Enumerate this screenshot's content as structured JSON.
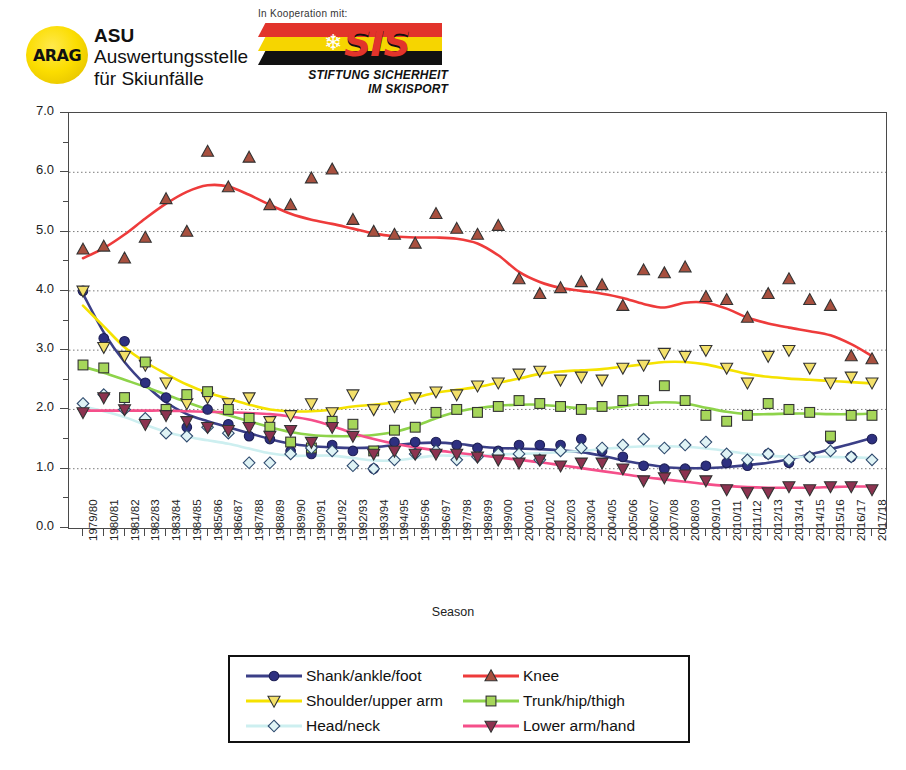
{
  "header": {
    "arag_logo_text": "ARAG",
    "asu_line1": "ASU",
    "asu_line2": "Auswertungsstelle",
    "asu_line3": "für Skiunfälle",
    "kooperation_text": "In Kooperation mit:",
    "sis_wordmark": "SIS",
    "sis_sub1": "STIFTUNG SICHERHEIT",
    "sis_sub2": "IM SKISPORT"
  },
  "chart_data": {
    "type": "scatter",
    "title": "",
    "xlabel": "Season",
    "ylabel": "",
    "ylim": [
      0.0,
      7.0
    ],
    "ytick_labels": [
      "0.0",
      "1.0",
      "2.0",
      "3.0",
      "4.0",
      "5.0",
      "6.0",
      "7.0"
    ],
    "ytick_values": [
      0.0,
      1.0,
      2.0,
      3.0,
      4.0,
      5.0,
      6.0,
      7.0
    ],
    "yminor_step": 0.5,
    "grid": "horizontal-dotted",
    "legend_position": "bottom-center",
    "categories": [
      "1979/80",
      "1980/81",
      "1981/82",
      "1982/83",
      "1983/84",
      "1984/85",
      "1985/86",
      "1986/87",
      "1987/88",
      "1988/89",
      "1989/90",
      "1990/91",
      "1991/92",
      "1992/93",
      "1993/94",
      "1994/95",
      "1995/96",
      "1996/97",
      "1997/98",
      "1998/99",
      "1999/00",
      "2000/01",
      "2001/02",
      "2002/03",
      "2003/04",
      "2004/05",
      "2005/06",
      "2006/07",
      "2007/08",
      "2008/09",
      "2009/10",
      "2010/11",
      "2011/12",
      "2012/13",
      "2013/14",
      "2014/15",
      "2015/16",
      "2016/17",
      "2017/18"
    ],
    "series": [
      {
        "name": "Shank/ankle/foot",
        "color": "#3b3f87",
        "marker": "circle",
        "marker_fill": "#2e3080",
        "values": [
          4.0,
          3.2,
          3.15,
          2.45,
          2.2,
          1.7,
          2.0,
          1.75,
          1.55,
          1.5,
          1.3,
          1.25,
          1.4,
          1.3,
          1.0,
          1.45,
          1.45,
          1.45,
          1.4,
          1.35,
          1.3,
          1.4,
          1.4,
          1.4,
          1.5,
          1.3,
          1.2,
          1.05,
          1.0,
          1.0,
          1.05,
          1.1,
          1.05,
          1.25,
          1.1,
          1.2,
          1.5,
          1.2,
          1.5
        ],
        "trend": [
          3.95,
          3.3,
          2.8,
          2.42,
          2.12,
          1.92,
          1.8,
          1.7,
          1.6,
          1.5,
          1.42,
          1.38,
          1.36,
          1.35,
          1.36,
          1.4,
          1.43,
          1.44,
          1.42,
          1.38,
          1.35,
          1.34,
          1.33,
          1.31,
          1.28,
          1.22,
          1.14,
          1.08,
          1.03,
          1.01,
          1.01,
          1.03,
          1.06,
          1.1,
          1.16,
          1.24,
          1.33,
          1.42,
          1.52
        ]
      },
      {
        "name": "Knee",
        "color": "#ee3b3b",
        "marker": "triangle-up",
        "marker_fill": "#a8503f",
        "values": [
          4.7,
          4.75,
          4.55,
          4.9,
          5.55,
          5.0,
          6.35,
          5.75,
          6.25,
          5.45,
          5.45,
          5.9,
          6.05,
          5.2,
          5.0,
          4.95,
          4.8,
          5.3,
          5.05,
          4.95,
          5.1,
          4.2,
          3.95,
          4.05,
          4.15,
          4.1,
          3.75,
          4.35,
          4.3,
          4.4,
          3.9,
          3.85,
          3.55,
          3.95,
          4.2,
          3.85,
          3.75,
          2.9,
          2.85
        ],
        "trend": [
          4.55,
          4.72,
          4.95,
          5.22,
          5.47,
          5.67,
          5.78,
          5.76,
          5.62,
          5.45,
          5.3,
          5.2,
          5.13,
          5.05,
          4.97,
          4.92,
          4.9,
          4.9,
          4.88,
          4.8,
          4.6,
          4.32,
          4.15,
          4.05,
          4.0,
          3.95,
          3.88,
          3.78,
          3.72,
          3.8,
          3.8,
          3.7,
          3.55,
          3.45,
          3.38,
          3.32,
          3.25,
          3.1,
          2.9
        ]
      },
      {
        "name": "Shoulder/upper arm",
        "color": "#f5e200",
        "marker": "triangle-down",
        "marker_fill": "#f3e06a",
        "values": [
          4.0,
          3.05,
          2.9,
          2.75,
          2.45,
          2.1,
          2.2,
          2.1,
          2.2,
          1.8,
          1.9,
          2.1,
          1.95,
          2.25,
          2.0,
          2.05,
          2.2,
          2.3,
          2.25,
          2.4,
          2.45,
          2.6,
          2.65,
          2.5,
          2.55,
          2.5,
          2.7,
          2.75,
          2.95,
          2.9,
          3.0,
          2.7,
          2.45,
          2.9,
          3.0,
          2.7,
          2.45,
          2.55,
          2.45
        ],
        "trend": [
          3.75,
          3.4,
          3.05,
          2.8,
          2.6,
          2.42,
          2.28,
          2.18,
          2.08,
          2.0,
          1.97,
          1.97,
          2.0,
          2.05,
          2.08,
          2.12,
          2.2,
          2.28,
          2.33,
          2.38,
          2.45,
          2.52,
          2.6,
          2.64,
          2.66,
          2.68,
          2.72,
          2.76,
          2.8,
          2.8,
          2.76,
          2.68,
          2.6,
          2.55,
          2.52,
          2.5,
          2.48,
          2.46,
          2.44
        ]
      },
      {
        "name": "Trunk/hip/thigh",
        "color": "#8ed34a",
        "marker": "square",
        "marker_fill": "#a6d65a",
        "values": [
          2.75,
          2.7,
          2.2,
          2.8,
          2.0,
          2.25,
          2.3,
          2.0,
          1.85,
          1.7,
          1.45,
          1.35,
          1.8,
          1.75,
          1.3,
          1.65,
          1.7,
          1.95,
          2.0,
          1.95,
          2.05,
          2.15,
          2.1,
          2.05,
          2.0,
          2.05,
          2.15,
          2.15,
          2.4,
          2.15,
          1.9,
          1.8,
          1.9,
          2.1,
          2.0,
          1.95,
          1.55,
          1.9,
          1.9
        ],
        "trend": [
          2.72,
          2.62,
          2.5,
          2.38,
          2.25,
          2.12,
          2.0,
          1.9,
          1.8,
          1.7,
          1.62,
          1.57,
          1.55,
          1.55,
          1.57,
          1.62,
          1.72,
          1.85,
          1.96,
          2.02,
          2.06,
          2.08,
          2.08,
          2.05,
          2.02,
          2.02,
          2.05,
          2.1,
          2.12,
          2.1,
          2.03,
          1.96,
          1.92,
          1.92,
          1.93,
          1.93,
          1.92,
          1.92,
          1.93
        ]
      },
      {
        "name": "Head/neck",
        "color": "#cdeff0",
        "marker": "diamond",
        "marker_fill": "#dff3f5",
        "values": [
          2.1,
          2.25,
          2.0,
          1.85,
          1.6,
          1.55,
          1.7,
          1.6,
          1.1,
          1.1,
          1.25,
          1.35,
          1.3,
          1.05,
          1.0,
          1.15,
          1.25,
          1.3,
          1.15,
          1.2,
          1.25,
          1.25,
          1.15,
          1.3,
          1.35,
          1.35,
          1.4,
          1.5,
          1.35,
          1.4,
          1.45,
          1.25,
          1.15,
          1.25,
          1.15,
          1.2,
          1.3,
          1.2,
          1.15
        ],
        "trend": [
          2.05,
          1.97,
          1.87,
          1.74,
          1.62,
          1.54,
          1.48,
          1.42,
          1.34,
          1.26,
          1.22,
          1.22,
          1.22,
          1.18,
          1.14,
          1.14,
          1.18,
          1.22,
          1.22,
          1.22,
          1.24,
          1.25,
          1.26,
          1.28,
          1.3,
          1.33,
          1.36,
          1.38,
          1.38,
          1.37,
          1.34,
          1.3,
          1.25,
          1.22,
          1.2,
          1.2,
          1.2,
          1.19,
          1.18
        ]
      },
      {
        "name": "Lower arm/hand",
        "color": "#f54f8a",
        "marker": "triangle-down",
        "marker_fill": "#8c3350",
        "values": [
          1.95,
          2.2,
          2.0,
          1.75,
          1.9,
          1.8,
          1.7,
          1.65,
          1.7,
          1.55,
          1.65,
          1.45,
          1.7,
          1.55,
          1.25,
          1.3,
          1.25,
          1.25,
          1.25,
          1.2,
          1.15,
          1.1,
          1.15,
          1.05,
          1.1,
          1.1,
          1.0,
          0.8,
          0.85,
          0.9,
          0.8,
          0.65,
          0.6,
          0.6,
          0.7,
          0.65,
          0.7,
          0.7,
          0.65
        ],
        "trend": [
          1.98,
          1.98,
          1.98,
          1.98,
          1.98,
          1.97,
          1.96,
          1.95,
          1.94,
          1.92,
          1.88,
          1.82,
          1.72,
          1.6,
          1.5,
          1.42,
          1.36,
          1.31,
          1.27,
          1.23,
          1.19,
          1.15,
          1.11,
          1.06,
          1.01,
          0.96,
          0.91,
          0.86,
          0.82,
          0.78,
          0.74,
          0.71,
          0.69,
          0.68,
          0.68,
          0.68,
          0.69,
          0.7,
          0.7
        ]
      }
    ]
  },
  "legend": {
    "items": [
      {
        "label": "Shank/ankle/foot"
      },
      {
        "label": "Knee"
      },
      {
        "label": "Shoulder/upper arm"
      },
      {
        "label": "Trunk/hip/thigh"
      },
      {
        "label": "Head/neck"
      },
      {
        "label": "Lower arm/hand"
      }
    ]
  }
}
